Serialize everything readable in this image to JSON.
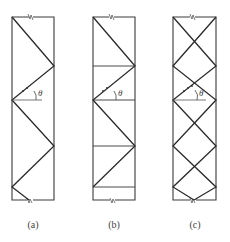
{
  "figure": {
    "panels": [
      {
        "id": "a",
        "caption": "(a)",
        "angle_label": "θ",
        "type": "single-diagonal (warren) lacing"
      },
      {
        "id": "b",
        "caption": "(b)",
        "angle_label": "θ",
        "type": "single-diagonal lacing with horizontal battens"
      },
      {
        "id": "c",
        "caption": "(c)",
        "angle_label": "θ",
        "type": "double (cross) lacing"
      }
    ],
    "colors": {
      "line": "#2a2a2a",
      "background": "#ffffff"
    }
  }
}
